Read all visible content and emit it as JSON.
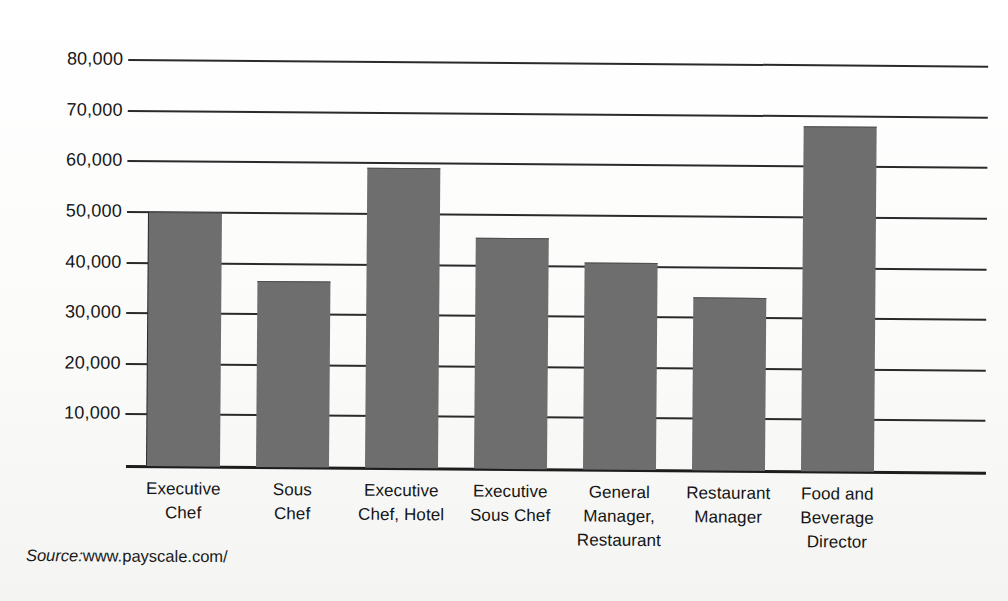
{
  "chart_data": {
    "type": "bar",
    "title": "",
    "subtitle": "",
    "xlabel": "",
    "ylabel": "",
    "categories": [
      "Executive Chef",
      "Sous Chef",
      "Executive Chef, Hotel",
      "Executive Sous Chef",
      "General Manager, Restaurant",
      "Restaurant Manager",
      "Food and Beverage Director"
    ],
    "category_lines": [
      [
        "Executive",
        "Chef"
      ],
      [
        "Sous",
        "Chef"
      ],
      [
        "Executive",
        "Chef, Hotel"
      ],
      [
        "Executive",
        "Sous Chef"
      ],
      [
        "General",
        "Manager,",
        "Restaurant"
      ],
      [
        "Restaurant",
        "Manager"
      ],
      [
        "Food and",
        "Beverage",
        "Director"
      ]
    ],
    "values": [
      50000,
      36500,
      59000,
      45500,
      40600,
      34000,
      68000
    ],
    "ylim": [
      0,
      80000
    ],
    "yticks": [
      10000,
      20000,
      30000,
      40000,
      50000,
      60000,
      70000,
      80000
    ],
    "ytick_labels": [
      "10,000",
      "20,000",
      "30,000",
      "40,000",
      "50,000",
      "60,000",
      "70,000",
      "80,000"
    ],
    "grid": true,
    "legend": false,
    "legend_position": "none",
    "bar_color": "#6e6e6e",
    "axis_color": "#2a2a2a",
    "background_color": "#ffffff"
  },
  "source": {
    "label": "Source:",
    "url": "www.payscale.com/"
  }
}
